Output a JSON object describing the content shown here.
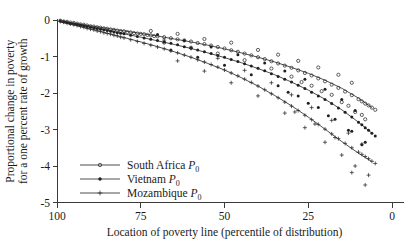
{
  "chart_data": {
    "type": "scatter",
    "title": "",
    "subtitle": "",
    "xlabel": "Location of poverty line (percentile of distribution)",
    "ylabel_line1": "Proportional change in poverty",
    "ylabel_line2": "for a one percent rate of growth",
    "xlim": [
      100,
      0
    ],
    "ylim": [
      -5,
      0
    ],
    "x_reversed": true,
    "grid": false,
    "legend_position": "bottom-left",
    "xticks": [
      100,
      75,
      50,
      25,
      0
    ],
    "xtick_labels": [
      "100",
      "75",
      "50",
      "25",
      "0"
    ],
    "yticks": [
      0,
      -1,
      -2,
      -3,
      -4,
      -5
    ],
    "ytick_labels": [
      "0",
      "-1",
      "-2",
      "-3",
      "-4",
      "-5"
    ],
    "legend": [
      {
        "name": "South Africa",
        "sub": "0",
        "symbol": "P",
        "marker": "circle"
      },
      {
        "name": "Vietnam",
        "sub": "0",
        "symbol": "P",
        "marker": "dot"
      },
      {
        "name": "Mozambique",
        "sub": "0",
        "symbol": "P",
        "marker": "plus"
      }
    ],
    "series": [
      {
        "name": "South Africa P0",
        "marker": "circle",
        "fit": {
          "x": [
            99,
            95,
            90,
            85,
            80,
            75,
            70,
            65,
            60,
            55,
            50,
            45,
            40,
            35,
            30,
            25,
            20,
            15,
            10,
            6
          ],
          "y": [
            -0.03,
            -0.09,
            -0.16,
            -0.23,
            -0.3,
            -0.37,
            -0.44,
            -0.52,
            -0.6,
            -0.69,
            -0.79,
            -0.9,
            -1.02,
            -1.15,
            -1.3,
            -1.46,
            -1.65,
            -1.87,
            -2.14,
            -2.4
          ]
        },
        "points": [
          [
            99,
            -0.02
          ],
          [
            98,
            -0.04
          ],
          [
            97,
            -0.05
          ],
          [
            96,
            -0.07
          ],
          [
            95,
            -0.08
          ],
          [
            94,
            -0.1
          ],
          [
            93,
            -0.12
          ],
          [
            92,
            -0.13
          ],
          [
            91,
            -0.15
          ],
          [
            90,
            -0.17
          ],
          [
            89,
            -0.18
          ],
          [
            88,
            -0.2
          ],
          [
            87,
            -0.21
          ],
          [
            86,
            -0.23
          ],
          [
            85,
            -0.24
          ],
          [
            84,
            -0.26
          ],
          [
            83,
            -0.27
          ],
          [
            82,
            -0.29
          ],
          [
            81,
            -0.3
          ],
          [
            80,
            -0.31
          ],
          [
            79,
            -0.33
          ],
          [
            78,
            -0.34
          ],
          [
            77,
            -0.36
          ],
          [
            76,
            -0.37
          ],
          [
            75,
            -0.38
          ],
          [
            74,
            -0.39
          ],
          [
            73,
            -0.41
          ],
          [
            72,
            -0.42
          ],
          [
            71,
            -0.44
          ],
          [
            70,
            -0.45
          ],
          [
            68,
            -0.47
          ],
          [
            66,
            -0.5
          ],
          [
            64,
            -0.53
          ],
          [
            62,
            -0.56
          ],
          [
            60,
            -0.59
          ],
          [
            58,
            -0.63
          ],
          [
            56,
            -0.66
          ],
          [
            54,
            -0.7
          ],
          [
            52,
            -0.74
          ],
          [
            50,
            -0.78
          ],
          [
            48,
            -0.83
          ],
          [
            46,
            -0.87
          ],
          [
            44,
            -0.92
          ],
          [
            42,
            -0.97
          ],
          [
            40,
            -1.02
          ],
          [
            38,
            -1.07
          ],
          [
            36,
            -1.13
          ],
          [
            34,
            -1.19
          ],
          [
            32,
            -1.25
          ],
          [
            30,
            -1.31
          ],
          [
            28,
            -1.38
          ],
          [
            26,
            -1.45
          ],
          [
            24,
            -1.52
          ],
          [
            22,
            -1.6
          ],
          [
            20,
            -1.68
          ],
          [
            18,
            -1.77
          ],
          [
            16,
            -1.86
          ],
          [
            14,
            -1.96
          ],
          [
            12,
            -2.06
          ],
          [
            10,
            -2.17
          ],
          [
            9,
            -2.23
          ],
          [
            8,
            -2.29
          ],
          [
            7,
            -2.34
          ],
          [
            6,
            -2.4
          ],
          [
            5,
            -2.46
          ],
          [
            72,
            -0.3
          ],
          [
            64,
            -0.38
          ],
          [
            56,
            -0.52
          ],
          [
            48,
            -0.62
          ],
          [
            40,
            -0.82
          ],
          [
            34,
            -0.95
          ],
          [
            28,
            -1.12
          ],
          [
            22,
            -1.3
          ],
          [
            16,
            -1.5
          ],
          [
            12,
            -1.72
          ],
          [
            68,
            -0.62
          ],
          [
            60,
            -0.76
          ],
          [
            52,
            -0.92
          ],
          [
            44,
            -1.1
          ],
          [
            36,
            -1.33
          ],
          [
            30,
            -1.55
          ],
          [
            24,
            -1.8
          ],
          [
            18,
            -2.05
          ],
          [
            13,
            -2.35
          ],
          [
            9,
            -2.6
          ],
          [
            8,
            -2.72
          ],
          [
            11,
            -2.52
          ],
          [
            15,
            -2.25
          ],
          [
            21,
            -1.95
          ],
          [
            27,
            -1.7
          ]
        ]
      },
      {
        "name": "Vietnam P0",
        "marker": "dot",
        "fit": {
          "x": [
            99,
            95,
            90,
            85,
            80,
            75,
            70,
            65,
            60,
            55,
            50,
            45,
            40,
            35,
            30,
            25,
            20,
            15,
            10,
            6
          ],
          "y": [
            -0.04,
            -0.11,
            -0.2,
            -0.29,
            -0.38,
            -0.47,
            -0.57,
            -0.67,
            -0.78,
            -0.9,
            -1.03,
            -1.17,
            -1.33,
            -1.5,
            -1.7,
            -1.92,
            -2.17,
            -2.46,
            -2.8,
            -3.1
          ]
        },
        "points": [
          [
            99,
            -0.03
          ],
          [
            98,
            -0.05
          ],
          [
            97,
            -0.07
          ],
          [
            96,
            -0.09
          ],
          [
            95,
            -0.1
          ],
          [
            94,
            -0.12
          ],
          [
            93,
            -0.14
          ],
          [
            92,
            -0.16
          ],
          [
            91,
            -0.18
          ],
          [
            90,
            -0.2
          ],
          [
            89,
            -0.22
          ],
          [
            88,
            -0.23
          ],
          [
            87,
            -0.25
          ],
          [
            86,
            -0.27
          ],
          [
            85,
            -0.29
          ],
          [
            84,
            -0.31
          ],
          [
            83,
            -0.33
          ],
          [
            82,
            -0.35
          ],
          [
            81,
            -0.36
          ],
          [
            80,
            -0.38
          ],
          [
            78,
            -0.42
          ],
          [
            76,
            -0.45
          ],
          [
            74,
            -0.49
          ],
          [
            72,
            -0.53
          ],
          [
            70,
            -0.56
          ],
          [
            68,
            -0.6
          ],
          [
            66,
            -0.64
          ],
          [
            64,
            -0.68
          ],
          [
            62,
            -0.73
          ],
          [
            60,
            -0.77
          ],
          [
            58,
            -0.82
          ],
          [
            56,
            -0.87
          ],
          [
            54,
            -0.92
          ],
          [
            52,
            -0.97
          ],
          [
            50,
            -1.02
          ],
          [
            48,
            -1.08
          ],
          [
            46,
            -1.14
          ],
          [
            44,
            -1.2
          ],
          [
            42,
            -1.26
          ],
          [
            40,
            -1.32
          ],
          [
            38,
            -1.39
          ],
          [
            36,
            -1.47
          ],
          [
            34,
            -1.55
          ],
          [
            32,
            -1.62
          ],
          [
            30,
            -1.7
          ],
          [
            28,
            -1.79
          ],
          [
            26,
            -1.88
          ],
          [
            24,
            -1.98
          ],
          [
            22,
            -2.08
          ],
          [
            20,
            -2.18
          ],
          [
            18,
            -2.29
          ],
          [
            16,
            -2.41
          ],
          [
            14,
            -2.53
          ],
          [
            12,
            -2.66
          ],
          [
            10,
            -2.8
          ],
          [
            9,
            -2.87
          ],
          [
            8,
            -2.95
          ],
          [
            7,
            -3.02
          ],
          [
            6,
            -3.1
          ],
          [
            5,
            -3.18
          ],
          [
            70,
            -0.4
          ],
          [
            62,
            -0.56
          ],
          [
            54,
            -0.74
          ],
          [
            46,
            -0.95
          ],
          [
            38,
            -1.18
          ],
          [
            32,
            -1.4
          ],
          [
            26,
            -1.62
          ],
          [
            20,
            -1.9
          ],
          [
            15,
            -2.18
          ],
          [
            11,
            -2.48
          ],
          [
            66,
            -0.82
          ],
          [
            58,
            -1.02
          ],
          [
            50,
            -1.24
          ],
          [
            42,
            -1.5
          ],
          [
            34,
            -1.8
          ],
          [
            28,
            -2.08
          ],
          [
            22,
            -2.4
          ],
          [
            17,
            -2.72
          ],
          [
            12,
            -3.05
          ],
          [
            8,
            -3.35
          ],
          [
            9,
            -3.42
          ],
          [
            13,
            -3.02
          ],
          [
            19,
            -2.62
          ],
          [
            25,
            -2.28
          ],
          [
            31,
            -1.98
          ]
        ]
      },
      {
        "name": "Mozambique P0",
        "marker": "plus",
        "fit": {
          "x": [
            99,
            95,
            90,
            85,
            80,
            75,
            70,
            65,
            60,
            55,
            50,
            45,
            40,
            35,
            30,
            25,
            20,
            15,
            10,
            6
          ],
          "y": [
            -0.05,
            -0.14,
            -0.25,
            -0.36,
            -0.48,
            -0.6,
            -0.73,
            -0.87,
            -1.02,
            -1.19,
            -1.37,
            -1.58,
            -1.81,
            -2.07,
            -2.35,
            -2.66,
            -2.99,
            -3.33,
            -3.65,
            -3.88
          ]
        },
        "points": [
          [
            99,
            -0.04
          ],
          [
            98,
            -0.06
          ],
          [
            97,
            -0.09
          ],
          [
            96,
            -0.11
          ],
          [
            95,
            -0.13
          ],
          [
            94,
            -0.15
          ],
          [
            93,
            -0.18
          ],
          [
            92,
            -0.2
          ],
          [
            91,
            -0.23
          ],
          [
            90,
            -0.25
          ],
          [
            89,
            -0.27
          ],
          [
            88,
            -0.3
          ],
          [
            87,
            -0.32
          ],
          [
            86,
            -0.35
          ],
          [
            85,
            -0.37
          ],
          [
            84,
            -0.39
          ],
          [
            83,
            -0.42
          ],
          [
            82,
            -0.44
          ],
          [
            81,
            -0.47
          ],
          [
            80,
            -0.49
          ],
          [
            78,
            -0.54
          ],
          [
            76,
            -0.59
          ],
          [
            74,
            -0.64
          ],
          [
            72,
            -0.69
          ],
          [
            70,
            -0.74
          ],
          [
            68,
            -0.79
          ],
          [
            66,
            -0.85
          ],
          [
            64,
            -0.9
          ],
          [
            62,
            -0.96
          ],
          [
            60,
            -1.02
          ],
          [
            58,
            -1.09
          ],
          [
            56,
            -1.15
          ],
          [
            54,
            -1.22
          ],
          [
            52,
            -1.29
          ],
          [
            50,
            -1.37
          ],
          [
            48,
            -1.45
          ],
          [
            46,
            -1.53
          ],
          [
            44,
            -1.62
          ],
          [
            42,
            -1.71
          ],
          [
            40,
            -1.81
          ],
          [
            38,
            -1.91
          ],
          [
            36,
            -2.02
          ],
          [
            34,
            -2.13
          ],
          [
            32,
            -2.25
          ],
          [
            30,
            -2.36
          ],
          [
            28,
            -2.48
          ],
          [
            26,
            -2.61
          ],
          [
            24,
            -2.73
          ],
          [
            22,
            -2.86
          ],
          [
            20,
            -2.99
          ],
          [
            18,
            -3.12
          ],
          [
            16,
            -3.25
          ],
          [
            14,
            -3.38
          ],
          [
            12,
            -3.5
          ],
          [
            10,
            -3.62
          ],
          [
            9,
            -3.68
          ],
          [
            8,
            -3.74
          ],
          [
            7,
            -3.8
          ],
          [
            6,
            -3.87
          ],
          [
            5,
            -3.93
          ],
          [
            68,
            -0.55
          ],
          [
            60,
            -0.78
          ],
          [
            52,
            -1.05
          ],
          [
            44,
            -1.38
          ],
          [
            36,
            -1.72
          ],
          [
            30,
            -2.05
          ],
          [
            24,
            -2.4
          ],
          [
            18,
            -2.75
          ],
          [
            13,
            -3.1
          ],
          [
            9,
            -3.4
          ],
          [
            64,
            -1.12
          ],
          [
            56,
            -1.4
          ],
          [
            48,
            -1.72
          ],
          [
            40,
            -2.08
          ],
          [
            32,
            -2.55
          ],
          [
            26,
            -2.95
          ],
          [
            20,
            -3.35
          ],
          [
            15,
            -3.7
          ],
          [
            11,
            -4.0
          ],
          [
            7,
            -4.25
          ],
          [
            12,
            -4.18
          ],
          [
            8,
            -4.52
          ],
          [
            17,
            -3.22
          ],
          [
            23,
            -2.85
          ],
          [
            29,
            -2.52
          ]
        ]
      }
    ]
  }
}
